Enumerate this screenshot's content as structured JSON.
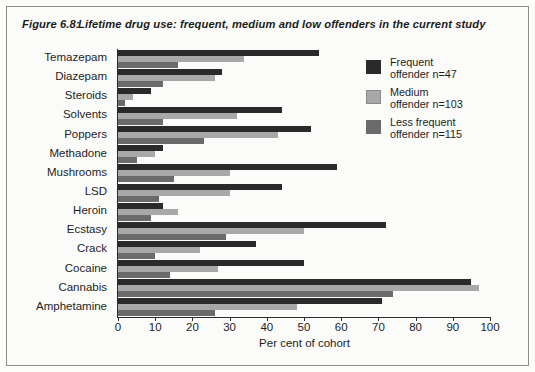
{
  "figure": {
    "number": "Figure 6.8:",
    "title": "Lifetime drug use: frequent, medium and low offenders in the current study"
  },
  "legend": {
    "entries": [
      {
        "label": "Frequent\noffender n=47",
        "color": "#2a2a2a"
      },
      {
        "label": "Medium\noffender n=103",
        "color": "#a8a8a8"
      },
      {
        "label": "Less frequent\noffender n=115",
        "color": "#6b6b6b"
      }
    ]
  },
  "chart_data": {
    "type": "bar",
    "orientation": "horizontal",
    "title": "Lifetime drug use: frequent, medium and low offenders in the current study",
    "xlabel": "Per cent of cohort",
    "ylabel": "",
    "xlim": [
      0,
      100
    ],
    "xticks": [
      0,
      10,
      20,
      30,
      40,
      50,
      60,
      70,
      80,
      90,
      100
    ],
    "xtick_labels": [
      "0",
      "10",
      "20",
      "30",
      "40",
      "50",
      "60",
      "70",
      "80",
      "90",
      "100"
    ],
    "grid": false,
    "legend_position": "upper right",
    "categories": [
      "Temazepam",
      "Diazepam",
      "Steroids",
      "Solvents",
      "Poppers",
      "Methadone",
      "Mushrooms",
      "LSD",
      "Heroin",
      "Ecstasy",
      "Crack",
      "Cocaine",
      "Cannabis",
      "Amphetamine"
    ],
    "series": [
      {
        "name": "Frequent offender n=47",
        "color": "#2a2a2a",
        "values": [
          54,
          28,
          9,
          44,
          52,
          12,
          59,
          44,
          12,
          72,
          37,
          50,
          95,
          71
        ]
      },
      {
        "name": "Medium offender n=103",
        "color": "#a8a8a8",
        "values": [
          34,
          26,
          4,
          32,
          43,
          10,
          30,
          30,
          16,
          50,
          22,
          27,
          97,
          48
        ]
      },
      {
        "name": "Less frequent offender n=115",
        "color": "#6b6b6b",
        "values": [
          16,
          12,
          2,
          12,
          23,
          5,
          15,
          11,
          9,
          29,
          10,
          14,
          74,
          26
        ]
      }
    ]
  }
}
